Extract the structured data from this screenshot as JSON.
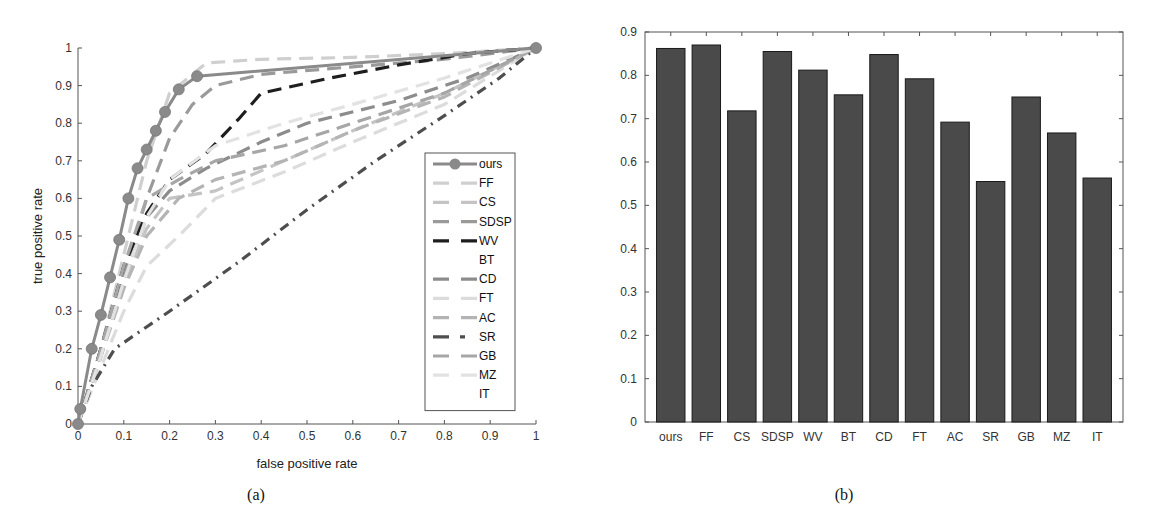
{
  "chart_data": [
    {
      "type": "line",
      "panel": "(a)",
      "xlabel": "false positive rate",
      "ylabel": "true positive rate",
      "xlim": [
        0,
        1
      ],
      "ylim": [
        0,
        1
      ],
      "xticks": [
        "0",
        "0.1",
        "0.2",
        "0.3",
        "0.4",
        "0.5",
        "0.6",
        "0.7",
        "0.8",
        "0.9",
        "1"
      ],
      "yticks": [
        "0",
        "0.1",
        "0.2",
        "0.3",
        "0.4",
        "0.5",
        "0.6",
        "0.7",
        "0.8",
        "0.9",
        "1"
      ],
      "grid": false,
      "legend_position": "inside right",
      "series": [
        {
          "name": "ours",
          "color": "#8a8a8a",
          "dash": "solid",
          "marker": "circle",
          "x": [
            0,
            0.005,
            0.03,
            0.05,
            0.07,
            0.09,
            0.11,
            0.13,
            0.15,
            0.17,
            0.19,
            0.22,
            0.26,
            1
          ],
          "y": [
            0,
            0.04,
            0.2,
            0.29,
            0.39,
            0.49,
            0.6,
            0.68,
            0.73,
            0.78,
            0.83,
            0.89,
            0.925,
            1
          ]
        },
        {
          "name": "FF",
          "color": "#cfcfcf",
          "dash": "dash",
          "x": [
            0,
            0.05,
            0.1,
            0.15,
            0.2,
            0.28,
            0.4,
            0.6,
            0.8,
            1
          ],
          "y": [
            0,
            0.2,
            0.45,
            0.7,
            0.88,
            0.96,
            0.97,
            0.975,
            0.985,
            1
          ]
        },
        {
          "name": "CS",
          "color": "#c4c4c4",
          "dash": "dash",
          "x": [
            0,
            0.05,
            0.1,
            0.15,
            0.2,
            0.3,
            0.45,
            0.6,
            0.8,
            1
          ],
          "y": [
            0,
            0.18,
            0.38,
            0.52,
            0.6,
            0.62,
            0.7,
            0.78,
            0.88,
            1
          ]
        },
        {
          "name": "SDSP",
          "color": "#9a9a9a",
          "dash": "dash",
          "x": [
            0,
            0.05,
            0.1,
            0.15,
            0.2,
            0.25,
            0.3,
            0.4,
            0.6,
            0.8,
            1
          ],
          "y": [
            0,
            0.2,
            0.4,
            0.6,
            0.76,
            0.85,
            0.9,
            0.93,
            0.95,
            0.97,
            1
          ]
        },
        {
          "name": "WV",
          "color": "#1e1e1e",
          "dash": "dash",
          "x": [
            0,
            0.05,
            0.1,
            0.15,
            0.2,
            0.28,
            0.35,
            0.4,
            0.55,
            0.7,
            0.85,
            1
          ],
          "y": [
            0,
            0.2,
            0.42,
            0.56,
            0.65,
            0.72,
            0.81,
            0.88,
            0.92,
            0.955,
            0.985,
            1
          ]
        },
        {
          "name": "BT",
          "color": "#ffffff",
          "dash": "none",
          "x": [
            0,
            1
          ],
          "y": [
            0,
            1
          ]
        },
        {
          "name": "CD",
          "color": "#8c8c8c",
          "dash": "dash",
          "x": [
            0,
            0.05,
            0.1,
            0.15,
            0.2,
            0.28,
            0.4,
            0.5,
            0.7,
            0.85,
            1
          ],
          "y": [
            0,
            0.18,
            0.38,
            0.55,
            0.62,
            0.68,
            0.75,
            0.8,
            0.86,
            0.92,
            1
          ]
        },
        {
          "name": "FT",
          "color": "#dcdcdc",
          "dash": "dash",
          "x": [
            0,
            0.05,
            0.1,
            0.15,
            0.22,
            0.3,
            0.45,
            0.6,
            0.8,
            1
          ],
          "y": [
            0,
            0.15,
            0.3,
            0.42,
            0.5,
            0.6,
            0.67,
            0.75,
            0.85,
            1
          ]
        },
        {
          "name": "AC",
          "color": "#b4b4b4",
          "dash": "dash",
          "x": [
            0,
            0.05,
            0.1,
            0.15,
            0.22,
            0.3,
            0.45,
            0.6,
            0.8,
            1
          ],
          "y": [
            0,
            0.18,
            0.36,
            0.5,
            0.6,
            0.65,
            0.7,
            0.78,
            0.87,
            1
          ]
        },
        {
          "name": "SR",
          "color": "#4e4e4e",
          "dash": "dashdot",
          "x": [
            0,
            0.03,
            0.08,
            0.2,
            0.35,
            0.5,
            0.65,
            0.8,
            0.92,
            1
          ],
          "y": [
            0,
            0.1,
            0.2,
            0.3,
            0.43,
            0.57,
            0.7,
            0.82,
            0.92,
            1
          ]
        },
        {
          "name": "GB",
          "color": "#a6a6a6",
          "dash": "dash",
          "x": [
            0,
            0.05,
            0.1,
            0.15,
            0.22,
            0.3,
            0.45,
            0.6,
            0.8,
            1
          ],
          "y": [
            0,
            0.2,
            0.42,
            0.6,
            0.65,
            0.7,
            0.74,
            0.8,
            0.88,
            1
          ]
        },
        {
          "name": "MZ",
          "color": "#e2e2e2",
          "dash": "dash",
          "x": [
            0,
            0.05,
            0.1,
            0.15,
            0.2,
            0.3,
            0.45,
            0.6,
            0.8,
            1
          ],
          "y": [
            0,
            0.18,
            0.38,
            0.55,
            0.65,
            0.74,
            0.8,
            0.85,
            0.92,
            1
          ]
        },
        {
          "name": "IT",
          "color": "#ffffff",
          "dash": "none",
          "x": [
            0,
            1
          ],
          "y": [
            0,
            1
          ]
        }
      ]
    },
    {
      "type": "bar",
      "panel": "(b)",
      "title": "",
      "xlabel": "",
      "ylabel": "",
      "ylim": [
        0,
        0.9
      ],
      "yticks": [
        "0",
        "0.1",
        "0.2",
        "0.3",
        "0.4",
        "0.5",
        "0.6",
        "0.7",
        "0.8",
        "0.9"
      ],
      "grid": false,
      "bar_color": "#4a4a4a",
      "categories": [
        "ours",
        "FF",
        "CS",
        "SDSP",
        "WV",
        "BT",
        "CD",
        "FT",
        "AC",
        "SR",
        "GB",
        "MZ",
        "IT"
      ],
      "values": [
        0.862,
        0.87,
        0.718,
        0.855,
        0.812,
        0.755,
        0.848,
        0.792,
        0.692,
        0.555,
        0.75,
        0.667,
        0.563
      ]
    }
  ],
  "captions": {
    "a": "(a)",
    "b": "(b)"
  }
}
